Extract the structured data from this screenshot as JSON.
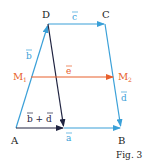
{
  "figure": {
    "caption": "Fig. 3",
    "colors": {
      "blue": "#3aa0d8",
      "red": "#e8602c",
      "dark": "#1f2340",
      "label_dark": "#222222"
    },
    "points": {
      "A": {
        "label": "A",
        "x": 16,
        "y": 128
      },
      "B": {
        "label": "B",
        "x": 121,
        "y": 128
      },
      "C": {
        "label": "C",
        "x": 105,
        "y": 24
      },
      "D": {
        "label": "D",
        "x": 48,
        "y": 24
      },
      "M1": {
        "label": "M",
        "sub": "1",
        "x": 31,
        "y": 77
      },
      "M2": {
        "label": "M",
        "sub": "2",
        "x": 114,
        "y": 77
      }
    },
    "vectors": {
      "a": "a",
      "b": "b",
      "c": "c",
      "d": "d",
      "e": "e",
      "b_plus_d": "b + d"
    }
  }
}
